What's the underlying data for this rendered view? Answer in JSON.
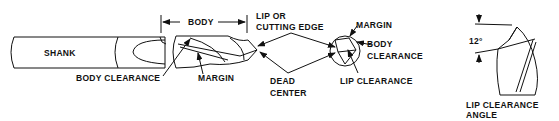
{
  "diagram": {
    "labels": {
      "shank": "SHANK",
      "body": "BODY",
      "lip_line1": "LIP OR",
      "lip_line2": "CUTTING EDGE",
      "body_clearance": "BODY CLEARANCE",
      "margin": "MARGIN",
      "dead_line1": "DEAD",
      "dead_line2": "CENTER",
      "end_margin": "MARGIN",
      "end_body_line1": "BODY",
      "end_body_line2": "CLEARANCE",
      "lip_clearance": "LIP CLEARANCE",
      "angle_value": "12°",
      "angle_line1": "LIP CLEARANCE",
      "angle_line2": "ANGLE"
    },
    "colors": {
      "ink": "#111111",
      "background": "#ffffff"
    }
  }
}
